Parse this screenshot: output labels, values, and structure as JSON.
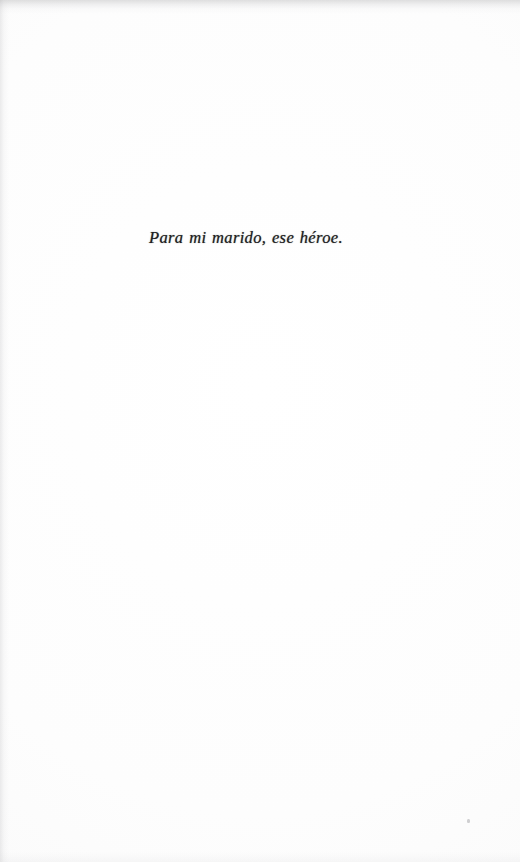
{
  "document": {
    "kind": "book-dedication-page",
    "page_background_color": "#fcfcfc",
    "ink_color": "#1d1d21"
  },
  "dedication": {
    "text": "Para mi marido, ese héroe.",
    "style": "italic",
    "alignment": "center"
  },
  "artifacts": {
    "speck_label": ""
  }
}
